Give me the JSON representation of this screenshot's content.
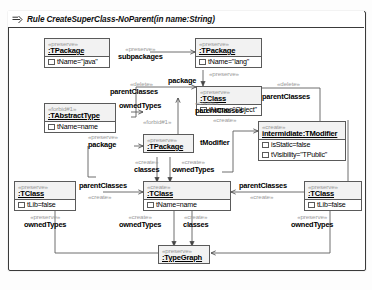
{
  "diagram": {
    "title": "Rule CreateSuperClass-NoParent(in name:String)",
    "title_icon": "rule-arrow-icon",
    "type": "graph-transformation-rule"
  },
  "nodes": [
    {
      "id": "pkg-java",
      "stereotype": "«preserve»",
      "name": ":TPackage",
      "attrs": [
        "tName=\"java\""
      ]
    },
    {
      "id": "pkg-lang",
      "stereotype": "«preserve»",
      "name": ":TPackage",
      "attrs": [
        "tName=\"lang\""
      ]
    },
    {
      "id": "abstract-type",
      "stereotype": "«forbid#1»",
      "name": ":TAbstractType",
      "attrs": [
        "tName=name"
      ]
    },
    {
      "id": "class-object",
      "stereotype": "«preserve»",
      "name": ":TClass",
      "attrs": [
        "tName=\"Object\""
      ]
    },
    {
      "id": "modifier",
      "stereotype": "«create»",
      "name": "intermidiate:TModifier",
      "attrs": [
        "isStatic=false",
        "tVisibility=\"TPublic\""
      ]
    },
    {
      "id": "pkg-mid",
      "stereotype": "«preserve»",
      "name": ":TPackage",
      "attrs": []
    },
    {
      "id": "class-left",
      "stereotype": "«preserve»",
      "name": ":TClass",
      "attrs": [
        "tLib=false"
      ]
    },
    {
      "id": "class-new",
      "stereotype": "«create»",
      "name": ":TClass",
      "attrs": [
        "tName=name"
      ]
    },
    {
      "id": "class-right",
      "stereotype": "«preserve»",
      "name": ":TClass",
      "attrs": [
        "tLib=false"
      ]
    },
    {
      "id": "typegraph",
      "stereotype": "«preserve»",
      "name": ":TypeGraph",
      "attrs": []
    }
  ],
  "edges": [
    {
      "id": "e-subpackages",
      "stereotype": "«preserve»",
      "name": "subpackages"
    },
    {
      "id": "e-package-top",
      "stereotype": "«preserve»",
      "name": "package"
    },
    {
      "id": "e-parentclasses-d",
      "stereotype": "«delete»",
      "name": "parentClasses"
    },
    {
      "id": "e-ownedtypes-f",
      "stereotype": "«forbid#1»",
      "name": "ownedTypes"
    },
    {
      "id": "e-parentclasses-d2",
      "stereotype": "«delete»",
      "name": "parentClasses"
    },
    {
      "id": "e-parentclasses-c",
      "stereotype": "«create»",
      "name": "parentClasses"
    },
    {
      "id": "e-tmodifier",
      "stereotype": "«create»",
      "name": "tModifier"
    },
    {
      "id": "e-package-mid",
      "stereotype": "«preserve»",
      "name": "package"
    },
    {
      "id": "e-classes-mid",
      "stereotype": "«create»",
      "name": "classes"
    },
    {
      "id": "e-ownedtypes-mid",
      "stereotype": "«create»",
      "name": "ownedTypes"
    },
    {
      "id": "e-parentclasses-l",
      "stereotype": "«create»",
      "name": "parentClasses"
    },
    {
      "id": "e-parentclasses-r",
      "stereotype": "«create»",
      "name": "parentClasses"
    },
    {
      "id": "e-ownedtypes-l",
      "stereotype": "«preserve»",
      "name": "ownedTypes"
    },
    {
      "id": "e-ownedtypes-c",
      "stereotype": "«create»",
      "name": "ownedTypes"
    },
    {
      "id": "e-classes-c",
      "stereotype": "«create»",
      "name": "classes"
    },
    {
      "id": "e-ownedtypes-r",
      "stereotype": "«preserve»",
      "name": "ownedTypes"
    }
  ]
}
